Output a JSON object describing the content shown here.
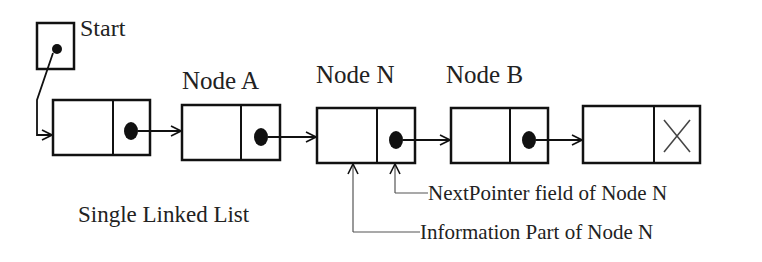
{
  "diagram": {
    "title": "Single Linked List",
    "start_label": "Start",
    "nodes": [
      {
        "label": "",
        "info": "",
        "next": "pointer"
      },
      {
        "label": "Node A",
        "info": "",
        "next": "pointer"
      },
      {
        "label": "Node N",
        "info": "",
        "next": "pointer"
      },
      {
        "label": "Node B",
        "info": "",
        "next": "pointer"
      },
      {
        "label": "",
        "info": "",
        "next": "null"
      }
    ],
    "annotations": {
      "next_pointer": "NextPointer field of Node N",
      "info_part": "Information Part of Node N"
    },
    "null_symbol": "X"
  }
}
